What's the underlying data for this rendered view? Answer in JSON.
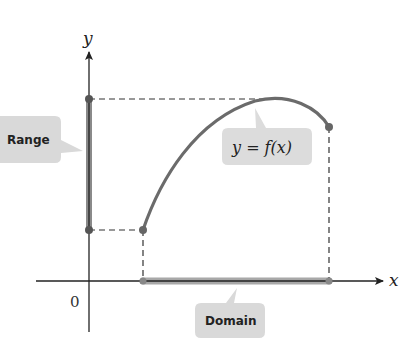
{
  "diagram": {
    "axes": {
      "x_label": "x",
      "y_label": "y",
      "origin_label": "0"
    },
    "callouts": {
      "range": "Range",
      "domain": "Domain",
      "function": "y = f(x)"
    },
    "colors": {
      "curve": "#6b6b6b",
      "highlight_bar": "#8a8a8a",
      "callout_fill": "#d9d9d9",
      "axis": "#222222",
      "dashed": "#333333"
    }
  }
}
